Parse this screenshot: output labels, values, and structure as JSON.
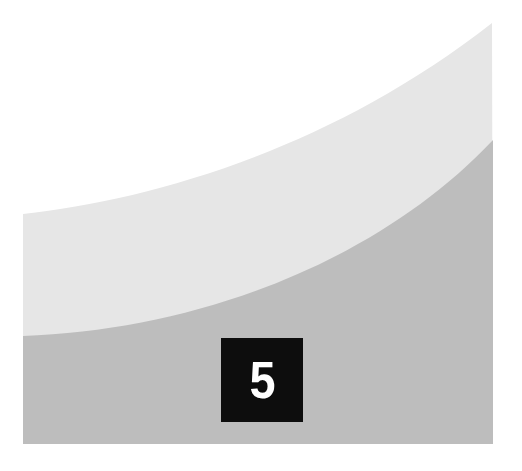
{
  "graphic": {
    "description": "Curved banded panel with number badge",
    "colors": {
      "background": "#ffffff",
      "light_band": "#e6e6e6",
      "dark_band": "#bdbdbd",
      "badge_bg": "#0d0d0d",
      "badge_text": "#ffffff"
    }
  },
  "badge": {
    "number": "5"
  }
}
